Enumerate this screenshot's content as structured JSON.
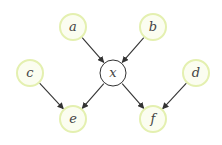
{
  "diagram": {
    "type": "directed-graph",
    "colors": {
      "observed_stroke": "#e4f0b0",
      "observed_fill": "#fbfdf0",
      "latent_stroke": "#333333",
      "latent_fill": "#ffffff",
      "edge": "#333333",
      "label": "#444444"
    },
    "nodes": [
      {
        "id": "a",
        "label": "a",
        "kind": "observed",
        "cx": 73,
        "cy": 27
      },
      {
        "id": "b",
        "label": "b",
        "kind": "observed",
        "cx": 153,
        "cy": 27
      },
      {
        "id": "c",
        "label": "c",
        "kind": "observed",
        "cx": 30,
        "cy": 73
      },
      {
        "id": "x",
        "label": "x",
        "kind": "latent",
        "cx": 113,
        "cy": 73
      },
      {
        "id": "d",
        "label": "d",
        "kind": "observed",
        "cx": 196,
        "cy": 73
      },
      {
        "id": "e",
        "label": "e",
        "kind": "observed",
        "cx": 73,
        "cy": 119
      },
      {
        "id": "f",
        "label": "f",
        "kind": "observed",
        "cx": 153,
        "cy": 119
      }
    ],
    "edges": [
      {
        "from": "a",
        "to": "x"
      },
      {
        "from": "b",
        "to": "x"
      },
      {
        "from": "x",
        "to": "e"
      },
      {
        "from": "x",
        "to": "f"
      },
      {
        "from": "c",
        "to": "e"
      },
      {
        "from": "d",
        "to": "f"
      }
    ]
  }
}
